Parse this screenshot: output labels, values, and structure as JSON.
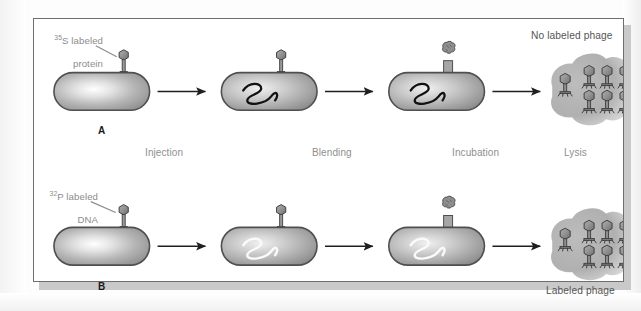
{
  "figure": {
    "title_alt": "Hershey-Chase experiment diagram",
    "panels": [
      {
        "letter": "A",
        "tracer_label_line1_sup": "35",
        "tracer_label_line1_rest": "S labeled",
        "tracer_label_line2": "protein",
        "result_caption": "No labeled phage",
        "result_caption_position": "top"
      },
      {
        "letter": "B",
        "tracer_label_line1_sup": "32",
        "tracer_label_line1_rest": "P labeled",
        "tracer_label_line2": "DNA",
        "result_caption": "Labeled phage",
        "result_caption_position": "bottom"
      }
    ],
    "stages": [
      {
        "name": "Injection"
      },
      {
        "name": "Blending"
      },
      {
        "name": "Incubation"
      },
      {
        "name": "Lysis"
      }
    ],
    "phage_count_in_lysate": 7,
    "colors": {
      "frame_border": "#6e6e6e",
      "frame_shadow": "#c9c9c9",
      "cell_body": "#a8a8a8",
      "cell_outline": "#555555",
      "phage_body": "#8e8e8e",
      "phage_outline": "#4a4a4a",
      "arrow": "#222222",
      "label_gray": "#8c8c8c",
      "caption_gray": "#555555",
      "dna_dark": "#151515",
      "dna_light": "#f2f2f2",
      "lysate_blob": "#b4b4b4"
    }
  }
}
